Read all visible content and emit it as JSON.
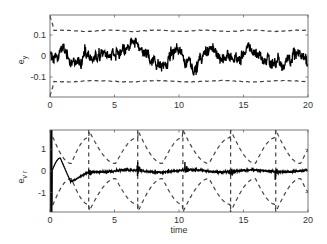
{
  "chart_data": [
    {
      "type": "line",
      "title": "",
      "xlabel": "",
      "ylabel": "e_y",
      "xlim": [
        0,
        20
      ],
      "ylim": [
        -0.195,
        0.195
      ],
      "xticks": [
        0,
        5,
        10,
        15,
        20
      ],
      "yticks": [
        -0.1,
        0,
        0.1
      ],
      "ytick_labels": [
        "-0.1",
        "0",
        "0.1"
      ],
      "grid": false,
      "series": [
        {
          "name": "error e_y",
          "style": "solid",
          "color": "#000000",
          "description": "noisy signal around 0 with amplitude ~0.07",
          "approx_range": [
            -0.08,
            0.08
          ]
        },
        {
          "name": "upper bound",
          "style": "dashed",
          "color": "#444444",
          "approx_value": 0.12
        },
        {
          "name": "lower bound",
          "style": "dashed",
          "color": "#444444",
          "approx_value": -0.12
        }
      ]
    },
    {
      "type": "line",
      "title": "",
      "xlabel": "time",
      "ylabel": "e_v_r",
      "xlim": [
        0,
        20
      ],
      "ylim": [
        -1.9,
        1.9
      ],
      "xticks": [
        0,
        5,
        10,
        15,
        20
      ],
      "yticks": [
        -1,
        0,
        1
      ],
      "ytick_labels": [
        "-1",
        "0",
        "1"
      ],
      "grid": false,
      "series": [
        {
          "name": "error e_vr",
          "style": "solid",
          "color": "#000000",
          "description": "initial transient peaking ~0.6 at t≈0.8, dip to ~-0.5 at t≈1.5, then small noise near 0 with spikes at t≈3, 7, 10.5, 14, 17.5"
        },
        {
          "name": "upper bound",
          "style": "dashed",
          "color": "#444444",
          "description": "sawtooth-like periodic bound between ~0.3 and ~1.9, resets at t≈3, 6.8, 10.3, 14, 17.5"
        },
        {
          "name": "lower bound",
          "style": "dashed",
          "color": "#444444",
          "description": "mirror of upper bound between ~-0.3 and ~-1.9"
        }
      ]
    }
  ],
  "labels": {
    "top_ylabel_main": "e",
    "top_ylabel_sub": "y",
    "bottom_ylabel_main": "e",
    "bottom_ylabel_sub": "v r",
    "xlabel": "time"
  }
}
